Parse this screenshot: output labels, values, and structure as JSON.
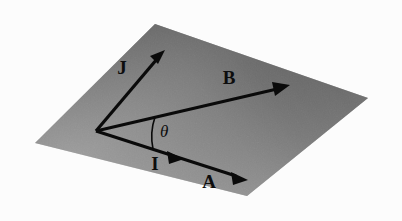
{
  "figure": {
    "background_color": "#fcfcfc",
    "plane": {
      "name": "shaded-plane",
      "shape": "parallelogram",
      "fill_dark": "#545454",
      "fill_mid": "#8d8d8d",
      "fill_light": "#a8a8a8",
      "vertices": [
        {
          "x": 155,
          "y": 24
        },
        {
          "x": 368,
          "y": 98
        },
        {
          "x": 247,
          "y": 196
        },
        {
          "x": 35,
          "y": 143
        }
      ]
    },
    "origin": {
      "x": 96,
      "y": 131
    },
    "vectors": [
      {
        "id": "J",
        "label": "J",
        "label_x": 122,
        "label_y": 74,
        "from": {
          "x": 96,
          "y": 131
        },
        "to": {
          "x": 163,
          "y": 52
        },
        "width": 3.2,
        "color": "#0a0a0a",
        "arrow_at": "end"
      },
      {
        "id": "B",
        "label": "B",
        "label_x": 229,
        "label_y": 84,
        "from": {
          "x": 96,
          "y": 131
        },
        "to": {
          "x": 288,
          "y": 86
        },
        "width": 3.2,
        "color": "#0a0a0a",
        "arrow_at": "end"
      },
      {
        "id": "I",
        "label": "I",
        "label_x": 155,
        "label_y": 170,
        "from": {
          "x": 96,
          "y": 131
        },
        "to": {
          "x": 182,
          "y": 158
        },
        "width": 3.2,
        "color": "#0a0a0a",
        "arrow_at": "mid"
      },
      {
        "id": "A",
        "label": "A",
        "label_x": 209,
        "label_y": 188,
        "from": {
          "x": 96,
          "y": 131
        },
        "to": {
          "x": 246,
          "y": 179
        },
        "width": 3.2,
        "color": "#0a0a0a",
        "arrow_at": "end"
      }
    ],
    "angle": {
      "id": "theta",
      "symbol": "θ",
      "label_x": 160,
      "label_y": 137,
      "arc_radius": 60,
      "between": [
        "I",
        "B"
      ],
      "color": "#0a0a0a"
    }
  }
}
